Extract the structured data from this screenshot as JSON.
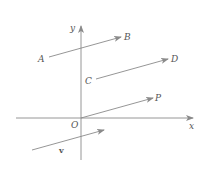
{
  "diagram": {
    "axes": {
      "x_label": "x",
      "y_label": "y",
      "origin_label": "O"
    },
    "vectors": [
      {
        "name": "AB",
        "start_label": "A",
        "end_label": "B"
      },
      {
        "name": "CD",
        "start_label": "C",
        "end_label": "D"
      },
      {
        "name": "OP",
        "start_label": "O",
        "end_label": "P"
      },
      {
        "name": "v",
        "label": "v"
      }
    ],
    "colors": {
      "line": "#8a8a8a",
      "text": "#555555",
      "background": "#ffffff"
    }
  }
}
